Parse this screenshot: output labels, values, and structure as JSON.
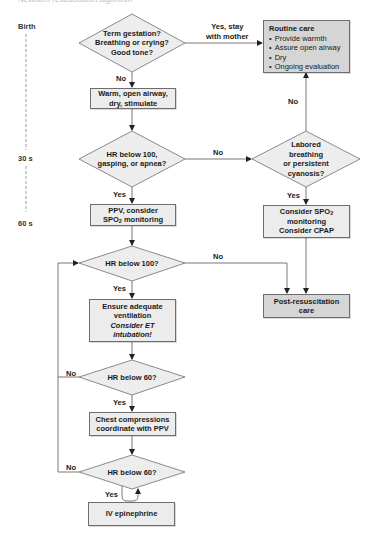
{
  "caption": "Newborn resuscitation algorithm",
  "colors": {
    "light_box": "#ececec",
    "dark_box": "#d5d5d5",
    "diamond_fill": "#ededed",
    "stroke": "#6e6e6e"
  },
  "timeline": {
    "labels": [
      "Birth",
      "30 s",
      "60 s"
    ]
  },
  "nodes": {
    "d_initial": {
      "lines": [
        "Term gestation?",
        "Breathing or crying?",
        "Good tone?"
      ]
    },
    "routine_care": {
      "title": "Routine care",
      "bullets": [
        "Provide warmth",
        "Assure open airway",
        "Dry",
        "Ongoing evaluation"
      ]
    },
    "warm": {
      "lines": [
        "Warm, open airway,",
        "dry, stimulate"
      ]
    },
    "d_hr100_gasp": {
      "lines": [
        "HR below 100,",
        "gasping, or apnea?"
      ]
    },
    "d_labored": {
      "lines": [
        "Labored",
        "breathing",
        "or persistent",
        "cyanosis?"
      ]
    },
    "ppv": {
      "line1": "PPV, consider",
      "line2_pre": "SPO",
      "line2_sub": "2",
      "line2_post": " monitoring"
    },
    "consider_spo2": {
      "line1_pre": "Consider SPO",
      "line1_sub": "2",
      "line2": "monitoring",
      "line3": "Consider CPAP"
    },
    "d_hr100": {
      "lines": [
        "HR below 100?"
      ]
    },
    "post_resus": {
      "lines": [
        "Post-resuscitation",
        "care"
      ]
    },
    "ensure": {
      "line1": "Ensure adequate",
      "line2": "ventilation",
      "line3": "Consider ET",
      "line4": "intubation!"
    },
    "d_hr60_a": {
      "lines": [
        "HR below 60?"
      ]
    },
    "chest": {
      "lines": [
        "Chest compressions",
        "coordinate with PPV"
      ]
    },
    "d_hr60_b": {
      "lines": [
        "HR below 60?"
      ]
    },
    "iv_epi": {
      "lines": [
        "IV epinephrine"
      ]
    }
  },
  "edge_labels": {
    "yes_stay_1": "Yes, stay",
    "yes_stay_2": "with mother",
    "no_to_warm": "No",
    "no_up_routine": "No",
    "no_to_labored": "No",
    "yes_to_ppv": "Yes",
    "yes_to_consider": "Yes",
    "no_to_post": "No",
    "yes_to_ensure": "Yes",
    "no_loop_a": "No",
    "yes_to_chest": "Yes",
    "no_loop_b": "No",
    "yes_to_epi": "Yes"
  }
}
